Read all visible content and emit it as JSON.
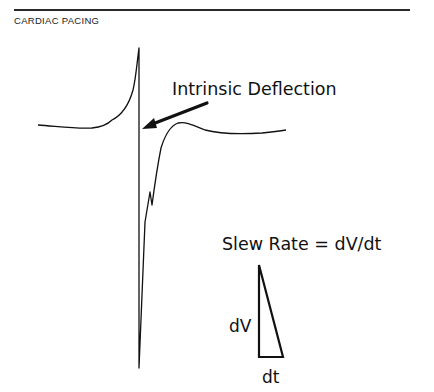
{
  "header": {
    "running_title": "CARDIAC PACING"
  },
  "figure": {
    "annotation_label": "Intrinsic Deflection",
    "equation_label": "Slew Rate = dV/dt",
    "triangle_vertical_label": "dV",
    "triangle_horizontal_label": "dt",
    "colors": {
      "ink": "#111111",
      "background": "#ffffff"
    }
  }
}
